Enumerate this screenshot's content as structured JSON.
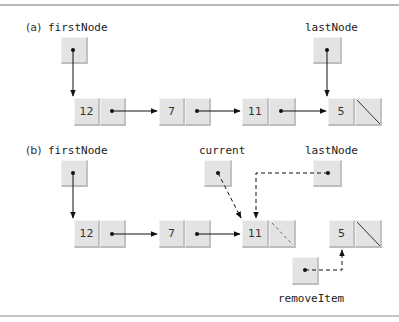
{
  "figure": {
    "parts": [
      {
        "id": "a",
        "label": "(a)",
        "pointers": {
          "firstNode": "firstNode",
          "lastNode": "lastNode"
        },
        "nodes": [
          {
            "value": "12",
            "next": "pointer"
          },
          {
            "value": "7",
            "next": "pointer"
          },
          {
            "value": "11",
            "next": "pointer"
          },
          {
            "value": "5",
            "next": "null"
          }
        ]
      },
      {
        "id": "b",
        "label": "(b)",
        "pointers": {
          "firstNode": "firstNode",
          "current": "current",
          "lastNode": "lastNode",
          "removeItem": "removeItem"
        },
        "nodes": [
          {
            "value": "12",
            "next": "pointer"
          },
          {
            "value": "7",
            "next": "pointer"
          },
          {
            "value": "11",
            "next": "null (dashed)"
          },
          {
            "value": "5",
            "next": "null"
          }
        ]
      }
    ],
    "colors": {
      "cell_fill": "#e3e3e3",
      "line": "#111111",
      "rule": "#b8b8b8"
    }
  }
}
